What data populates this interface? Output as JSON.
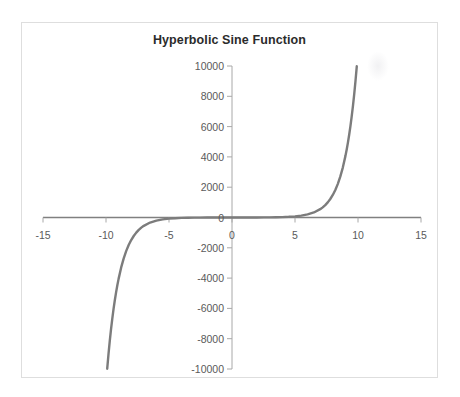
{
  "chart_data": {
    "type": "line",
    "title": "Hyperbolic Sine Function",
    "xlabel": "",
    "ylabel": "",
    "xlim": [
      -15,
      15
    ],
    "ylim": [
      -10000,
      10000
    ],
    "xticks": [
      -15,
      -10,
      -5,
      0,
      5,
      10,
      15
    ],
    "xtick_labels": [
      "-15",
      "-10",
      "-5",
      "0",
      "5",
      "10",
      "15"
    ],
    "yticks": [
      -10000,
      -8000,
      -6000,
      -4000,
      -2000,
      0,
      2000,
      4000,
      6000,
      8000,
      10000
    ],
    "ytick_labels": [
      "-10000",
      "-8000",
      "-6000",
      "-4000",
      "-2000",
      "0",
      "2000",
      "4000",
      "6000",
      "8000",
      "10000"
    ],
    "grid": false,
    "legend": false,
    "series": [
      {
        "name": "sinh(x)",
        "color": "#7c7c7c",
        "line_width": 2.4,
        "x": [
          -9.903,
          -9.8,
          -9.7,
          -9.6,
          -9.5,
          -9.4,
          -9.3,
          -9.2,
          -9.1,
          -9.0,
          -8.8,
          -8.6,
          -8.4,
          -8.2,
          -8.0,
          -7.8,
          -7.6,
          -7.4,
          -7.2,
          -7.0,
          -6.5,
          -6.0,
          -5.5,
          -5.0,
          -4.5,
          -4.0,
          -3.5,
          -3.0,
          -2.5,
          -2.0,
          -1.5,
          -1.0,
          -0.5,
          0.0,
          0.5,
          1.0,
          1.5,
          2.0,
          2.5,
          3.0,
          3.5,
          4.0,
          4.5,
          5.0,
          5.5,
          6.0,
          6.5,
          7.0,
          7.2,
          7.4,
          7.6,
          7.8,
          8.0,
          8.2,
          8.4,
          8.6,
          8.8,
          9.0,
          9.1,
          9.2,
          9.3,
          9.4,
          9.5,
          9.6,
          9.7,
          9.8,
          9.903
        ],
        "y": [
          -9979.5,
          -9005.6,
          -8148.6,
          -7372.9,
          -6671.0,
          -6035.9,
          -5461.3,
          -4941.4,
          -4470.9,
          -4051.5,
          -3310.1,
          -2710.4,
          -2219.5,
          -1817.6,
          -1490.5,
          -1221.0,
          -999.1,
          -817.9,
          -669.7,
          -548.3,
          -332.6,
          -201.7,
          -122.1,
          -74.2,
          -45.0,
          -27.3,
          -16.5,
          -10.0,
          -6.05,
          -3.63,
          -2.13,
          -1.18,
          -0.521,
          0.0,
          0.521,
          1.18,
          2.13,
          3.63,
          6.05,
          10.0,
          16.5,
          27.3,
          45.0,
          74.2,
          122.1,
          201.7,
          332.6,
          548.3,
          669.7,
          817.9,
          999.1,
          1221.0,
          1490.5,
          1817.6,
          2219.5,
          2710.4,
          3310.1,
          4051.5,
          4470.9,
          4941.4,
          5461.3,
          6035.9,
          6671.0,
          7372.9,
          8148.6,
          9005.6,
          9979.5
        ]
      }
    ]
  },
  "axes": {
    "axis_color": "#808080",
    "tick_color": "#a8a8a8",
    "label_color": "#5a5a5a",
    "frame_color": "#dedede"
  }
}
